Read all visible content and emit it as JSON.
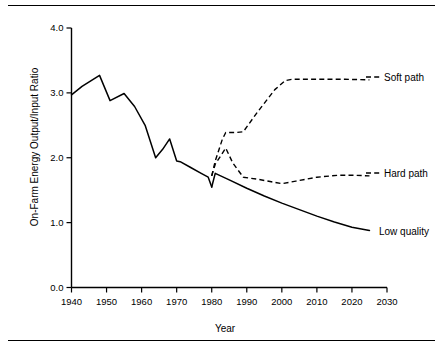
{
  "chart_data": {
    "type": "line",
    "title": "",
    "xlabel": "Year",
    "ylabel": "On-Farm Energy Output/Input Ratio",
    "xlim": [
      1940,
      2030
    ],
    "ylim": [
      0.0,
      4.0
    ],
    "grid": false,
    "legend_position": "right-inline",
    "xticks": [
      1940,
      1950,
      1960,
      1970,
      1980,
      1990,
      2000,
      2010,
      2020,
      2030
    ],
    "xtick_labels": [
      "1940",
      "1950",
      "1960",
      "1970",
      "1980",
      "1990",
      "2000",
      "2010",
      "2020",
      "2030"
    ],
    "yticks": [
      0.0,
      1.0,
      2.0,
      3.0,
      4.0
    ],
    "ytick_labels": [
      "0.0",
      "1.0",
      "2.0",
      "3.0",
      "4.0"
    ],
    "series": [
      {
        "name": "Historical",
        "style": "solid",
        "label": "",
        "x": [
          1940,
          1943,
          1948,
          1951,
          1955,
          1958,
          1961,
          1964,
          1966,
          1968,
          1970,
          1971,
          1974,
          1977,
          1979,
          1980
        ],
        "values": [
          2.97,
          3.1,
          3.27,
          2.88,
          2.99,
          2.79,
          2.5,
          2.0,
          2.13,
          2.29,
          1.95,
          1.94,
          1.85,
          1.76,
          1.7,
          1.55
        ]
      },
      {
        "name": "Low quality",
        "style": "solid",
        "label": "Low quality",
        "x": [
          1980,
          1981,
          1985,
          1990,
          1995,
          2000,
          2005,
          2010,
          2015,
          2020,
          2025
        ],
        "values": [
          1.55,
          1.76,
          1.66,
          1.53,
          1.41,
          1.3,
          1.2,
          1.1,
          1.01,
          0.93,
          0.88
        ]
      },
      {
        "name": "Hard path",
        "style": "dashed",
        "label": "Hard path",
        "x": [
          1980,
          1981,
          1984,
          1986,
          1989,
          1993,
          1997,
          2000,
          2004,
          2010,
          2016,
          2021,
          2025
        ],
        "values": [
          1.72,
          1.9,
          2.15,
          1.92,
          1.7,
          1.67,
          1.63,
          1.6,
          1.64,
          1.7,
          1.73,
          1.73,
          1.72
        ]
      },
      {
        "name": "Soft path",
        "style": "dashed",
        "label": "Soft path",
        "x": [
          1980,
          1981,
          1983,
          1984,
          1987,
          1989,
          1993,
          1998,
          2001,
          2003,
          2010,
          2018,
          2025
        ],
        "values": [
          1.72,
          1.95,
          2.28,
          2.39,
          2.39,
          2.4,
          2.7,
          3.05,
          3.19,
          3.21,
          3.21,
          3.21,
          3.2
        ]
      }
    ]
  },
  "axes": {
    "y_title": "On-Farm Energy Output/Input Ratio",
    "x_title": "Year",
    "ytick_0": "0.0",
    "ytick_1": "1.0",
    "ytick_2": "2.0",
    "ytick_3": "3.0",
    "ytick_4": "4.0",
    "xtick_1940": "1940",
    "xtick_1950": "1950",
    "xtick_1960": "1960",
    "xtick_1970": "1970",
    "xtick_1980": "1980",
    "xtick_1990": "1990",
    "xtick_2000": "2000",
    "xtick_2010": "2010",
    "xtick_2020": "2020",
    "xtick_2030": "2030"
  },
  "labels": {
    "soft_path": "Soft path",
    "hard_path": "Hard path",
    "low_quality": "Low quality"
  },
  "colors": {
    "ink": "#000000",
    "background": "#ffffff"
  }
}
